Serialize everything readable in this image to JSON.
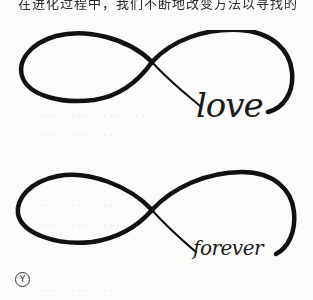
{
  "page": {
    "background": "#fbfbf9",
    "ink_color": "#111111",
    "top_text_clipped": "在进化过程中，我们不断地改变方法以寻找的",
    "bleed_lines": [
      "· · · · ·  · · · · · · · · · ·  · · ·",
      "· · · · · · ·  · · · · · · ·",
      "· · · ·  · · · · · · · · · · ·",
      "· · · · · · · · ·  · · · · ·",
      "· · · · ·  · · · · · · ·"
    ]
  },
  "figures": [
    {
      "id": "infinity-love",
      "word": "love"
    },
    {
      "id": "infinity-forever",
      "word": "forever"
    }
  ],
  "marker": {
    "symbol": "Y",
    "label": "circled-Y"
  }
}
